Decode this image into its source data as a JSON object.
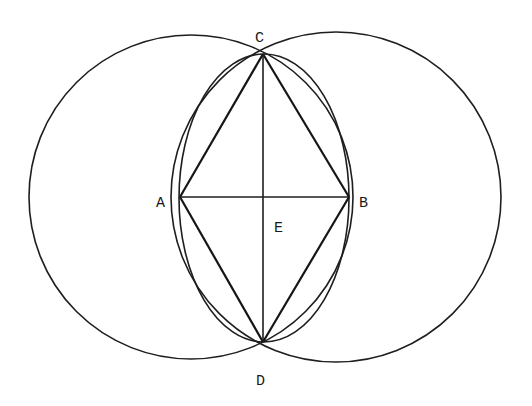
{
  "diagram": {
    "type": "geometric-construction",
    "points": {
      "A": {
        "label": "A",
        "x": 180,
        "y": 197
      },
      "B": {
        "label": "B",
        "x": 349,
        "y": 197
      },
      "C": {
        "label": "C",
        "x": 263,
        "y": 54
      },
      "D": {
        "label": "D",
        "x": 263,
        "y": 342
      },
      "E": {
        "label": "E",
        "x": 263,
        "y": 197
      }
    },
    "circles": [
      {
        "name": "left-circle",
        "cx": 191,
        "cy": 197,
        "r": 162
      },
      {
        "name": "right-circle",
        "cx": 336,
        "cy": 197,
        "r": 165
      }
    ],
    "ellipse": {
      "cx": 264,
      "cy": 198,
      "rx": 85,
      "ry": 144
    },
    "segments": [
      [
        "A",
        "C"
      ],
      [
        "C",
        "B"
      ],
      [
        "B",
        "D"
      ],
      [
        "D",
        "A"
      ],
      [
        "A",
        "B"
      ],
      [
        "C",
        "D"
      ]
    ],
    "labels": {
      "A": "A",
      "B": "B",
      "C": "C",
      "D": "D",
      "E": "E"
    },
    "colors": {
      "line": "#1e1e1e",
      "background": "#ffffff"
    }
  }
}
